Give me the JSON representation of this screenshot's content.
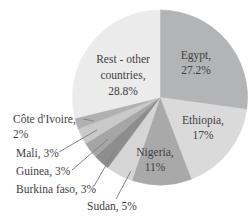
{
  "chart_data": {
    "type": "pie",
    "title": "",
    "center": {
      "cx": 160,
      "cy": 97.5,
      "r": 87.5
    },
    "start_angle_deg": 0,
    "direction": "clockwise",
    "slices": [
      {
        "name": "Egypt",
        "value": 27.2,
        "color": "#b3b4b6"
      },
      {
        "name": "Ethiopia",
        "value": 17,
        "color": "#dadada"
      },
      {
        "name": "Nigeria",
        "value": 11,
        "color": "#a9a9a9"
      },
      {
        "name": "Sudan",
        "value": 5,
        "color": "#d5d5d5"
      },
      {
        "name": "Burkina faso",
        "value": 3,
        "color": "#8d8d8d"
      },
      {
        "name": "Guinea",
        "value": 3,
        "color": "#a5a5a5"
      },
      {
        "name": "Mali",
        "value": 3,
        "color": "#c9c9c9"
      },
      {
        "name": "Côte d'Ivoire",
        "value": 2,
        "color": "#b0b0b0"
      },
      {
        "name": "Rest - other countries",
        "value": 28.8,
        "color": "#ebebeb"
      }
    ],
    "legend": "none",
    "labels_note": "large slices labeled inside; small slices labeled at left with leader lines"
  },
  "labels": {
    "rest": {
      "line1": "Rest - other",
      "line2": "countries,",
      "line3": "28.8%"
    },
    "egypt": {
      "line1": "Egypt,",
      "line2": "27.2%"
    },
    "ethiopia": {
      "line1": "Ethiopia,",
      "line2": "17%"
    },
    "nigeria": {
      "line1": "Nigeria,",
      "line2": "11%"
    },
    "cote_divoire": {
      "line1": "Côte d'Ivoire,",
      "line2": "2%"
    },
    "mali": "Mali, 3%",
    "guinea": "Guinea, 3%",
    "burkina_faso": "Burkina faso, 3%",
    "sudan": "Sudan, 5%"
  },
  "colors": {
    "background": "#ffffff",
    "text": "#3f3f3f",
    "leader_line": "#848484"
  }
}
